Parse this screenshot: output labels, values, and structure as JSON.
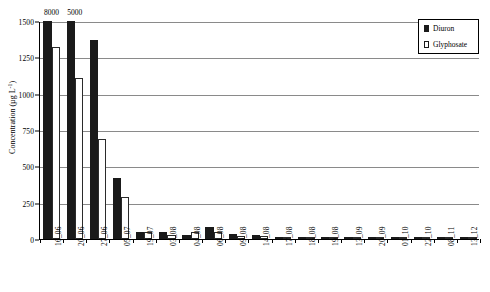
{
  "chart_data": {
    "type": "bar",
    "title": "",
    "xlabel": "",
    "ylabel": "Concentration (µg L",
    "ylabel_sup": "-1",
    "ylabel_close": ")",
    "ylim": [
      0,
      1500
    ],
    "yticks": [
      0,
      250,
      500,
      750,
      1000,
      1250,
      1500
    ],
    "grid": true,
    "legend_position": "top-right",
    "categories": [
      "16_06",
      "20_06",
      "27_06",
      "05_07",
      "19_07",
      "03_08",
      "04_08",
      "06_08",
      "09_08",
      "14_08",
      "17_08",
      "18_08",
      "19_08",
      "13_09",
      "20_09",
      "01_10",
      "22_10",
      "08_11",
      "13_12"
    ],
    "series": [
      {
        "name": "Diuron",
        "color": "#1a1a1a",
        "values": [
          1500,
          1500,
          1370,
          420,
          45,
          45,
          25,
          80,
          35,
          30,
          10,
          8,
          6,
          5,
          4,
          3,
          3,
          2,
          2
        ],
        "clipped_labels": [
          "8000",
          "5000",
          "",
          "",
          "",
          "",
          "",
          "",
          "",
          "",
          "",
          "",
          "",
          "",
          "",
          "",
          "",
          "",
          ""
        ]
      },
      {
        "name": "Glyphosate",
        "color": "#ffffff",
        "values": [
          1320,
          1110,
          690,
          290,
          45,
          30,
          50,
          45,
          20,
          18,
          12,
          10,
          8,
          7,
          6,
          5,
          4,
          3,
          2
        ],
        "clipped_labels": [
          "",
          "",
          "",
          "",
          "",
          "",
          "",
          "",
          "",
          "",
          "",
          "",
          "",
          "",
          "",
          "",
          "",
          "",
          ""
        ]
      }
    ]
  },
  "legend": {
    "entries": [
      {
        "label": "Diuron",
        "swatch": "filled-square-icon"
      },
      {
        "label": "Glyphosate",
        "swatch": "hollow-square-icon"
      }
    ]
  }
}
